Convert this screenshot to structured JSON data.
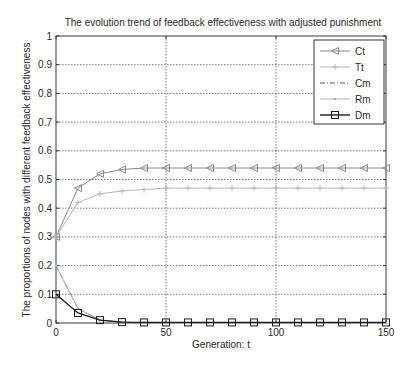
{
  "chart_data": {
    "type": "line",
    "title": "The evolution trend of feedback effectiveness with adjusted punishment",
    "xlabel": "Generation: t",
    "ylabel": "The proportions of nodes with different feedback effectiveness",
    "xlim": [
      0,
      150
    ],
    "ylim": [
      0,
      1
    ],
    "xticks": [
      0,
      50,
      100,
      150
    ],
    "xtick_labels": [
      "0",
      "50",
      "100",
      "150"
    ],
    "yticks": [
      0,
      0.1,
      0.2,
      0.3,
      0.4,
      0.5,
      0.6,
      0.7,
      0.8,
      0.9,
      1
    ],
    "ytick_labels": [
      "0",
      "0.1",
      "0.2",
      "0.3",
      "0.4",
      "0.5",
      "0.6",
      "0.7",
      "0.8",
      "0.9",
      "1"
    ],
    "grid": true,
    "legend_position": "top-right",
    "x": [
      0,
      10,
      20,
      30,
      40,
      50,
      60,
      70,
      80,
      90,
      100,
      110,
      120,
      130,
      140,
      150
    ],
    "series": [
      {
        "name": "Ct",
        "marker": "triangle-left",
        "line_style": "solid",
        "color": "#8a8a8a",
        "values": [
          0.3,
          0.47,
          0.52,
          0.535,
          0.54,
          0.54,
          0.54,
          0.54,
          0.54,
          0.54,
          0.54,
          0.54,
          0.54,
          0.54,
          0.54,
          0.54
        ]
      },
      {
        "name": "Tt",
        "marker": "plus",
        "line_style": "solid",
        "color": "#b8b8b8",
        "values": [
          0.3,
          0.42,
          0.45,
          0.46,
          0.465,
          0.47,
          0.47,
          0.47,
          0.47,
          0.47,
          0.47,
          0.47,
          0.47,
          0.47,
          0.47,
          0.47
        ]
      },
      {
        "name": "Cm",
        "marker": "none",
        "line_style": "dash-dot",
        "color": "#555555",
        "values": [
          0.2,
          0.05,
          0.01,
          0.003,
          0.001,
          0,
          0,
          0,
          0,
          0,
          0,
          0,
          0,
          0,
          0,
          0
        ]
      },
      {
        "name": "Rm",
        "marker": "dot",
        "line_style": "solid",
        "color": "#b0b0b0",
        "values": [
          0.2,
          0.05,
          0.01,
          0.003,
          0.001,
          0,
          0,
          0,
          0,
          0,
          0,
          0,
          0,
          0,
          0,
          0
        ]
      },
      {
        "name": "Dm",
        "marker": "square",
        "line_style": "solid",
        "color": "#1e1e1e",
        "values": [
          0.1,
          0.035,
          0.01,
          0.003,
          0.002,
          0.002,
          0.002,
          0.002,
          0.002,
          0.002,
          0.002,
          0.002,
          0.002,
          0.002,
          0.002,
          0.002
        ]
      }
    ]
  }
}
